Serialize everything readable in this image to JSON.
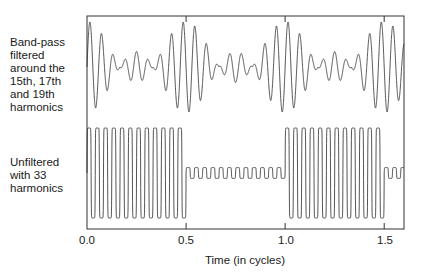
{
  "chart_data": {
    "type": "line",
    "title": "",
    "xlabel": "Time (in cycles)",
    "ylabel": "",
    "xlim": [
      0.0,
      1.6
    ],
    "x_ticks": [
      0.0,
      0.5,
      1.0,
      1.5
    ],
    "x_tick_labels": [
      "0.0",
      "0.5",
      "1.0",
      "1.5"
    ],
    "grid": false,
    "legend": "none",
    "series": [
      {
        "name": "Band-pass filtered around the 15th, 17th and 19th harmonics",
        "label": "Band-pass\nfiltered\naround the\n15th, 17th\nand 19th\nharmonics",
        "harmonics": [
          15,
          17,
          19
        ],
        "description": "Carrier near 17th harmonic with beating envelope; large amplitude near 0.0-0.5 and 1.0-1.5 cycles, small amplitude near 0.75 cycles"
      },
      {
        "name": "Unfiltered with 33 harmonics",
        "label": "Unfiltered\nwith 33\nharmonics",
        "harmonics_count": 33,
        "description": "Square-wave-like amplitude modulated carrier: full amplitude 0.0-0.5 and 1.0-1.5 cycles, small residual ripple in between"
      }
    ]
  },
  "colors": {
    "line": "#2a2a2a",
    "frame": "#333333",
    "background": "#ffffff"
  }
}
